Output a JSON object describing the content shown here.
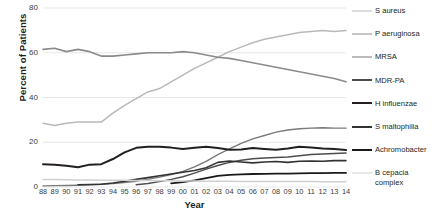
{
  "chart_data": {
    "type": "line",
    "title": "",
    "xlabel": "Year",
    "ylabel": "Percent of Patients",
    "ylim": [
      0,
      80
    ],
    "yticks": [
      0,
      20,
      40,
      60,
      80
    ],
    "grid": true,
    "legend_position": "right",
    "categories": [
      "88",
      "89",
      "90",
      "91",
      "92",
      "93",
      "94",
      "95",
      "96",
      "97",
      "98",
      "99",
      "00",
      "01",
      "02",
      "03",
      "04",
      "05",
      "06",
      "07",
      "08",
      "09",
      "10",
      "11",
      "12",
      "13",
      "14"
    ],
    "series": [
      {
        "name": "S aureus",
        "color": "#b9b9b9",
        "width": 1.5,
        "values": [
          28.5,
          27.5,
          28.5,
          29.0,
          29.0,
          29.0,
          33.0,
          36.5,
          39.5,
          42.5,
          44.0,
          47.0,
          50.0,
          53.0,
          55.5,
          58.0,
          60.5,
          62.5,
          64.5,
          66.0,
          67.0,
          68.0,
          69.0,
          69.5,
          70.0,
          69.5,
          70.0
        ]
      },
      {
        "name": "P aeruginosa",
        "color": "#8b8b8b",
        "width": 1.6,
        "values": [
          61.5,
          62.0,
          60.5,
          61.5,
          60.5,
          58.5,
          58.5,
          59.0,
          59.5,
          60.0,
          60.0,
          60.0,
          60.5,
          60.0,
          59.0,
          58.0,
          57.5,
          56.5,
          55.5,
          54.5,
          53.5,
          52.5,
          51.5,
          50.5,
          49.5,
          48.5,
          47.0
        ]
      },
      {
        "name": "MRSA",
        "color": "#7a7a7a",
        "width": 1.4,
        "values": [
          0.5,
          0.6,
          0.7,
          0.8,
          1.0,
          1.2,
          1.5,
          2.0,
          2.6,
          3.4,
          4.4,
          5.6,
          7.0,
          9.0,
          11.5,
          14.5,
          17.0,
          19.5,
          21.5,
          23.0,
          24.5,
          25.5,
          26.0,
          26.3,
          26.5,
          26.3,
          26.3
        ]
      },
      {
        "name": "MDR-PA",
        "color": "#4d4d4d",
        "width": 1.5,
        "values": [
          null,
          null,
          null,
          null,
          null,
          null,
          null,
          null,
          1.0,
          1.6,
          2.4,
          3.4,
          4.6,
          6.2,
          8.0,
          9.6,
          11.0,
          12.0,
          12.6,
          13.0,
          13.2,
          13.4,
          14.0,
          14.5,
          14.8,
          15.0,
          15.2
        ]
      },
      {
        "name": "H influenzae",
        "color": "#231f20",
        "width": 2.0,
        "values": [
          10.2,
          10.0,
          9.5,
          8.8,
          10.0,
          10.2,
          12.5,
          15.5,
          17.5,
          18.0,
          18.0,
          17.6,
          17.0,
          17.5,
          18.0,
          17.4,
          16.6,
          16.8,
          17.4,
          17.0,
          16.6,
          17.2,
          18.0,
          17.6,
          17.2,
          17.0,
          16.5
        ]
      },
      {
        "name": "S maltophilia",
        "color": "#333333",
        "width": 1.6,
        "values": [
          null,
          null,
          null,
          1.0,
          1.1,
          1.2,
          1.8,
          2.6,
          3.4,
          4.2,
          5.0,
          5.8,
          6.6,
          7.4,
          8.6,
          11.0,
          11.6,
          11.2,
          10.8,
          11.2,
          11.4,
          11.0,
          11.5,
          11.6,
          11.5,
          11.8,
          11.8
        ]
      },
      {
        "name": "Achromobacter",
        "color": "#1a1a1a",
        "width": 1.8,
        "values": [
          null,
          null,
          null,
          null,
          null,
          null,
          null,
          null,
          null,
          null,
          null,
          1.6,
          2.2,
          3.0,
          4.0,
          5.0,
          5.4,
          5.6,
          5.8,
          5.9,
          6.0,
          6.0,
          6.1,
          6.2,
          6.2,
          6.3,
          6.3
        ]
      },
      {
        "name": "B cepacia\ncomplex",
        "color": "#d0d0d0",
        "width": 1.5,
        "values": [
          3.4,
          3.3,
          3.2,
          3.1,
          3.1,
          3.0,
          3.0,
          3.0,
          2.9,
          2.9,
          2.8,
          2.8,
          2.7,
          2.7,
          2.6,
          2.6,
          2.6,
          2.5,
          2.5,
          2.5,
          2.5,
          2.5,
          2.5,
          2.5,
          2.4,
          2.4,
          2.4
        ]
      }
    ]
  },
  "axes": {
    "y_title": "Percent of Patients",
    "x_title": "Year",
    "y_tick_labels": [
      "80",
      "60",
      "40",
      "20",
      "0"
    ],
    "x_tick_labels": [
      "88",
      "89",
      "90",
      "91",
      "92",
      "93",
      "94",
      "95",
      "96",
      "97",
      "98",
      "99",
      "00",
      "01",
      "02",
      "03",
      "04",
      "05",
      "06",
      "07",
      "08",
      "09",
      "10",
      "11",
      "12",
      "13",
      "14"
    ]
  },
  "legend": {
    "items": [
      {
        "label": "S aureus",
        "color": "#b9b9b9",
        "width": 1.6
      },
      {
        "label": "P aeruginosa",
        "color": "#8b8b8b",
        "width": 1.8
      },
      {
        "label": "MRSA",
        "color": "#7a7a7a",
        "width": 1.6
      },
      {
        "label": "MDR-PA",
        "color": "#4d4d4d",
        "width": 2.0
      },
      {
        "label": "H influenzae",
        "color": "#231f20",
        "width": 2.4
      },
      {
        "label": "S maltophilia",
        "color": "#333333",
        "width": 2.0
      },
      {
        "label": "Achromobacter",
        "color": "#1a1a1a",
        "width": 2.2
      },
      {
        "label": "B cepacia\ncomplex",
        "color": "#d0d0d0",
        "width": 1.4
      }
    ]
  },
  "style": {
    "grid_color": "#e8e8e8",
    "background": "#ffffff",
    "text_color": "#231f20"
  }
}
